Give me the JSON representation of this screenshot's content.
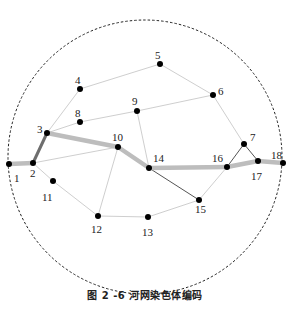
{
  "caption": "图 2 -6   河网染色体编码",
  "boundary": {
    "cx": 145,
    "cy": 157,
    "r": 137,
    "style": "dashed"
  },
  "colors": {
    "thin_edge": "#c8c8c8",
    "dark_edge": "#555555",
    "path_light": "#bdbdbd",
    "path_dark": "#6e6e6e",
    "node": "#000000"
  },
  "nodes": [
    {
      "id": "1",
      "x": 9,
      "y": 164,
      "lx": 14,
      "ly": 182
    },
    {
      "id": "2",
      "x": 33,
      "y": 163,
      "lx": 30,
      "ly": 177
    },
    {
      "id": "3",
      "x": 47,
      "y": 133,
      "lx": 37,
      "ly": 133
    },
    {
      "id": "4",
      "x": 80,
      "y": 89,
      "lx": 75,
      "ly": 84
    },
    {
      "id": "5",
      "x": 160,
      "y": 64,
      "lx": 155,
      "ly": 59
    },
    {
      "id": "6",
      "x": 213,
      "y": 95,
      "lx": 218,
      "ly": 95
    },
    {
      "id": "7",
      "x": 244,
      "y": 144,
      "lx": 250,
      "ly": 141
    },
    {
      "id": "8",
      "x": 80,
      "y": 122,
      "lx": 75,
      "ly": 117
    },
    {
      "id": "9",
      "x": 137,
      "y": 111,
      "lx": 132,
      "ly": 105
    },
    {
      "id": "10",
      "x": 118,
      "y": 147,
      "lx": 112,
      "ly": 141
    },
    {
      "id": "11",
      "x": 53,
      "y": 181,
      "lx": 42,
      "ly": 201
    },
    {
      "id": "12",
      "x": 98,
      "y": 216,
      "lx": 91,
      "ly": 233
    },
    {
      "id": "13",
      "x": 148,
      "y": 217,
      "lx": 142,
      "ly": 236
    },
    {
      "id": "14",
      "x": 149,
      "y": 168,
      "lx": 153,
      "ly": 162
    },
    {
      "id": "15",
      "x": 199,
      "y": 200,
      "lx": 195,
      "ly": 213
    },
    {
      "id": "16",
      "x": 227,
      "y": 167,
      "lx": 212,
      "ly": 162
    },
    {
      "id": "17",
      "x": 258,
      "y": 161,
      "lx": 251,
      "ly": 180
    },
    {
      "id": "18",
      "x": 283,
      "y": 163,
      "lx": 271,
      "ly": 159
    }
  ],
  "edges": [
    {
      "from": "3",
      "to": "4",
      "style": "thin"
    },
    {
      "from": "4",
      "to": "5",
      "style": "thin"
    },
    {
      "from": "5",
      "to": "6",
      "style": "thin"
    },
    {
      "from": "6",
      "to": "7",
      "style": "thin"
    },
    {
      "from": "3",
      "to": "8",
      "style": "thin"
    },
    {
      "from": "8",
      "to": "9",
      "style": "thin"
    },
    {
      "from": "9",
      "to": "6",
      "style": "thin"
    },
    {
      "from": "9",
      "to": "14",
      "style": "thin"
    },
    {
      "from": "2",
      "to": "10",
      "style": "thin"
    },
    {
      "from": "2",
      "to": "11",
      "style": "thin"
    },
    {
      "from": "11",
      "to": "12",
      "style": "thin"
    },
    {
      "from": "12",
      "to": "10",
      "style": "thin"
    },
    {
      "from": "12",
      "to": "13",
      "style": "thin"
    },
    {
      "from": "13",
      "to": "15",
      "style": "thin"
    },
    {
      "from": "15",
      "to": "16",
      "style": "thin"
    },
    {
      "from": "14",
      "to": "15",
      "style": "dark"
    },
    {
      "from": "16",
      "to": "7",
      "style": "dark"
    },
    {
      "from": "7",
      "to": "17",
      "style": "dark"
    },
    {
      "from": "1",
      "to": "2",
      "style": "path"
    },
    {
      "from": "2",
      "to": "3",
      "style": "path-dark"
    },
    {
      "from": "3",
      "to": "10",
      "style": "path"
    },
    {
      "from": "10",
      "to": "14",
      "style": "path"
    },
    {
      "from": "14",
      "to": "16",
      "style": "path"
    },
    {
      "from": "16",
      "to": "17",
      "style": "path"
    },
    {
      "from": "17",
      "to": "18",
      "style": "path"
    }
  ]
}
